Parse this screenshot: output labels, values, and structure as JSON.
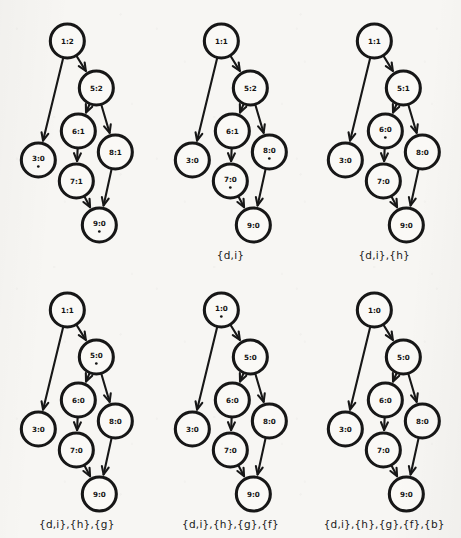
{
  "figure": {
    "type": "directed-graph-sequence",
    "panel_count": 6,
    "rows": 2,
    "columns": 3,
    "node_ids": [
      "1",
      "5",
      "6",
      "3",
      "8",
      "7",
      "9"
    ],
    "edges": [
      {
        "from": "1",
        "to": "3"
      },
      {
        "from": "1",
        "to": "5"
      },
      {
        "from": "5",
        "to": "6"
      },
      {
        "from": "5",
        "to": "8"
      },
      {
        "from": "6",
        "to": "7"
      },
      {
        "from": "7",
        "to": "9"
      },
      {
        "from": "8",
        "to": "9"
      }
    ],
    "layout": {
      "node_radius": 17,
      "positions": {
        "1": {
          "x": 67,
          "y": 41
        },
        "5": {
          "x": 96,
          "y": 88
        },
        "6": {
          "x": 78,
          "y": 131
        },
        "3": {
          "x": 38,
          "y": 160
        },
        "8": {
          "x": 115,
          "y": 152
        },
        "7": {
          "x": 76,
          "y": 181
        },
        "9": {
          "x": 99,
          "y": 225
        }
      }
    },
    "colors": {
      "background": "#f7f6f3",
      "node_fill": "#faf9f6",
      "node_stroke": "#171717",
      "edge": "#171717",
      "text": "#141414"
    }
  },
  "panels": [
    {
      "index": 1,
      "caption": "",
      "nodes": [
        {
          "id": "1",
          "label": "1:2",
          "count": 2,
          "marked": false
        },
        {
          "id": "5",
          "label": "5:2",
          "count": 2,
          "marked": false
        },
        {
          "id": "6",
          "label": "6:1",
          "count": 1,
          "marked": false
        },
        {
          "id": "3",
          "label": "3:0",
          "count": 0,
          "marked": true
        },
        {
          "id": "8",
          "label": "8:1",
          "count": 1,
          "marked": false
        },
        {
          "id": "7",
          "label": "7:1",
          "count": 1,
          "marked": false
        },
        {
          "id": "9",
          "label": "9:0",
          "count": 0,
          "marked": true
        }
      ]
    },
    {
      "index": 2,
      "caption": "{d,i}",
      "nodes": [
        {
          "id": "1",
          "label": "1:1",
          "count": 1,
          "marked": false
        },
        {
          "id": "5",
          "label": "5:2",
          "count": 2,
          "marked": false
        },
        {
          "id": "6",
          "label": "6:1",
          "count": 1,
          "marked": false
        },
        {
          "id": "3",
          "label": "3:0",
          "count": 0,
          "marked": false
        },
        {
          "id": "8",
          "label": "8:0",
          "count": 0,
          "marked": true
        },
        {
          "id": "7",
          "label": "7:0",
          "count": 0,
          "marked": true
        },
        {
          "id": "9",
          "label": "9:0",
          "count": 0,
          "marked": false
        }
      ]
    },
    {
      "index": 3,
      "caption": "{d,i},{h}",
      "nodes": [
        {
          "id": "1",
          "label": "1:1",
          "count": 1,
          "marked": false
        },
        {
          "id": "5",
          "label": "5:1",
          "count": 1,
          "marked": false
        },
        {
          "id": "6",
          "label": "6:0",
          "count": 0,
          "marked": true
        },
        {
          "id": "3",
          "label": "3:0",
          "count": 0,
          "marked": false
        },
        {
          "id": "8",
          "label": "8:0",
          "count": 0,
          "marked": false
        },
        {
          "id": "7",
          "label": "7:0",
          "count": 0,
          "marked": false
        },
        {
          "id": "9",
          "label": "9:0",
          "count": 0,
          "marked": false
        }
      ]
    },
    {
      "index": 4,
      "caption": "{d,i},{h},{g}",
      "nodes": [
        {
          "id": "1",
          "label": "1:1",
          "count": 1,
          "marked": false
        },
        {
          "id": "5",
          "label": "5:0",
          "count": 0,
          "marked": true
        },
        {
          "id": "6",
          "label": "6:0",
          "count": 0,
          "marked": false
        },
        {
          "id": "3",
          "label": "3:0",
          "count": 0,
          "marked": false
        },
        {
          "id": "8",
          "label": "8:0",
          "count": 0,
          "marked": false
        },
        {
          "id": "7",
          "label": "7:0",
          "count": 0,
          "marked": false
        },
        {
          "id": "9",
          "label": "9:0",
          "count": 0,
          "marked": false
        }
      ]
    },
    {
      "index": 5,
      "caption": "{d,i},{h},{g},{f}",
      "nodes": [
        {
          "id": "1",
          "label": "1:0",
          "count": 0,
          "marked": true
        },
        {
          "id": "5",
          "label": "5:0",
          "count": 0,
          "marked": false
        },
        {
          "id": "6",
          "label": "6:0",
          "count": 0,
          "marked": false
        },
        {
          "id": "3",
          "label": "3:0",
          "count": 0,
          "marked": false
        },
        {
          "id": "8",
          "label": "8:0",
          "count": 0,
          "marked": false
        },
        {
          "id": "7",
          "label": "7:0",
          "count": 0,
          "marked": false
        },
        {
          "id": "9",
          "label": "9:0",
          "count": 0,
          "marked": false
        }
      ]
    },
    {
      "index": 6,
      "caption": "{d,i},{h},{g},{f},{b}",
      "nodes": [
        {
          "id": "1",
          "label": "1:0",
          "count": 0,
          "marked": false
        },
        {
          "id": "5",
          "label": "5:0",
          "count": 0,
          "marked": false
        },
        {
          "id": "6",
          "label": "6:0",
          "count": 0,
          "marked": false
        },
        {
          "id": "3",
          "label": "3:0",
          "count": 0,
          "marked": false
        },
        {
          "id": "8",
          "label": "8:0",
          "count": 0,
          "marked": false
        },
        {
          "id": "7",
          "label": "7:0",
          "count": 0,
          "marked": false
        },
        {
          "id": "9",
          "label": "9:0",
          "count": 0,
          "marked": false
        }
      ]
    }
  ]
}
